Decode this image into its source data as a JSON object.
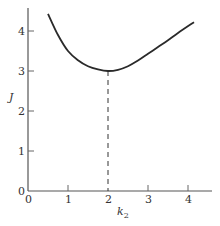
{
  "chart_data": {
    "type": "line",
    "title": "",
    "xlabel": "k_2",
    "ylabel": "J",
    "xlim": [
      0,
      4.6
    ],
    "ylim": [
      0,
      4.6
    ],
    "x_ticks": [
      0,
      1,
      2,
      3,
      4
    ],
    "y_ticks": [
      0,
      1,
      2,
      3,
      4
    ],
    "grid": false,
    "legend": null,
    "series": [
      {
        "name": "J(k2)",
        "x": [
          0.5,
          0.75,
          1.0,
          1.25,
          1.5,
          1.75,
          2.0,
          2.25,
          2.5,
          2.75,
          3.0,
          3.25,
          3.5,
          3.75,
          4.15
        ],
        "y": [
          4.43,
          3.9,
          3.5,
          3.27,
          3.12,
          3.04,
          3.0,
          3.03,
          3.12,
          3.26,
          3.43,
          3.6,
          3.77,
          3.95,
          4.22
        ]
      }
    ],
    "annotations": [
      {
        "type": "vertical-dashed-line",
        "x": 2,
        "y_from": 0,
        "y_to": 3,
        "label": "minimum at k2 = 2, J = 3"
      }
    ]
  },
  "labels": {
    "x_axis_main": "k",
    "x_axis_sub": "2",
    "y_axis": "J",
    "x_tick_labels": [
      "0",
      "1",
      "2",
      "3",
      "4"
    ],
    "y_tick_labels": [
      "0",
      "1",
      "2",
      "3",
      "4"
    ]
  }
}
